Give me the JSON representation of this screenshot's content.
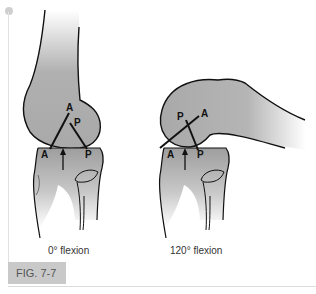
{
  "figure": {
    "label": "FIG. 7-7",
    "panels": [
      {
        "caption": "0° flexion",
        "femur_labels": {
          "anterior": "A",
          "posterior": "P"
        },
        "tibia_labels": {
          "anterior": "A",
          "posterior": "P"
        }
      },
      {
        "caption": "120° flexion",
        "femur_labels": {
          "anterior": "A",
          "posterior": "P"
        },
        "tibia_labels": {
          "anterior": "A",
          "posterior": "P"
        }
      }
    ]
  },
  "colors": {
    "bone_fill": "#a9a9a9",
    "outline": "#111111",
    "label_box": "#c9c9c9"
  }
}
